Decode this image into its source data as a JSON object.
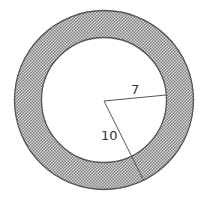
{
  "diagram": {
    "type": "annulus",
    "center": [
      104,
      100
    ],
    "outer_radius_label": "10",
    "inner_radius_label": "7",
    "shading": "dotted-gray",
    "colors": {
      "stroke": "#555555",
      "fill_dots": "#8a8a8a",
      "fill_bg": "#d6d6d6",
      "inner_fill": "#ffffff"
    }
  }
}
